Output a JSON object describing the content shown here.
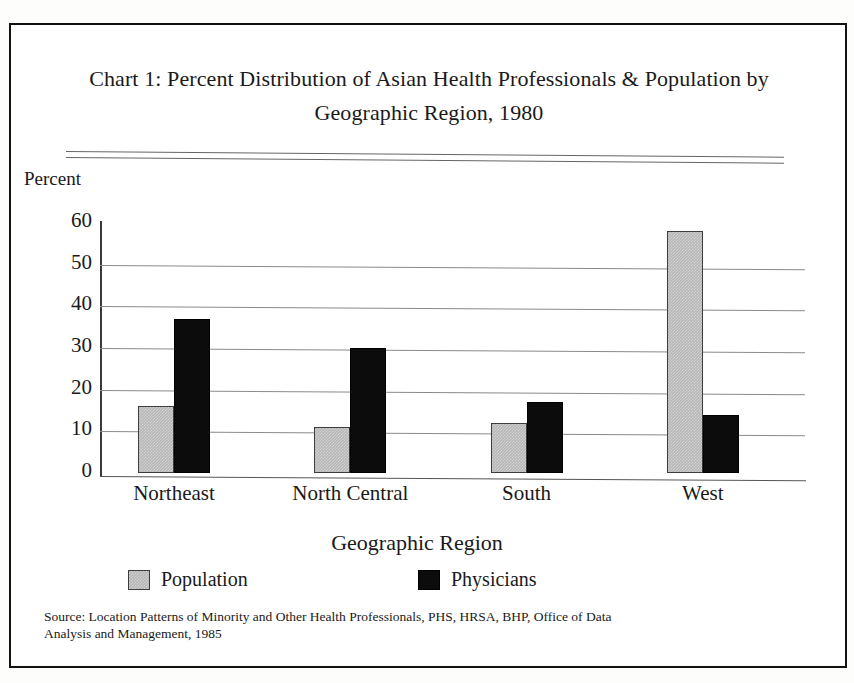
{
  "figure": {
    "title_line1": "Chart 1:  Percent Distribution of Asian Health Professionals & Population by",
    "title_line2": "Geographic Region, 1980",
    "y_axis_caption": "Percent",
    "x_axis_title": "Geographic Region",
    "source_line1": "Source:  Location Patterns of Minority and Other Health Professionals, PHS, HRSA, BHP, Office of Data",
    "source_line2": "Analysis and Management, 1985"
  },
  "colors": {
    "population": "#b6b6b6",
    "physicians": "#0c0c0c",
    "gridline": "#8a8a8a",
    "axis": "#3a3a3a",
    "text": "#1a1a1a",
    "page_background": "#ffffff",
    "border": "#111111"
  },
  "legend": {
    "position": "bottom",
    "entries": [
      {
        "label": "Population",
        "swatch": "population-swatch"
      },
      {
        "label": "Physicians",
        "swatch": "physicians-swatch"
      }
    ]
  },
  "chart_data": {
    "type": "bar",
    "title": "Chart 1:  Percent Distribution of Asian Health Professionals & Population by Geographic Region, 1980",
    "xlabel": "Geographic Region",
    "ylabel": "Percent",
    "ylim": [
      0,
      60
    ],
    "yticks": [
      0,
      10,
      20,
      30,
      40,
      50,
      60
    ],
    "ytick_labels": [
      "0",
      "10",
      "20",
      "30",
      "40",
      "50",
      "60"
    ],
    "grid": true,
    "grid_axis": "y",
    "categories": [
      "Northeast",
      "North Central",
      "South",
      "West"
    ],
    "series": [
      {
        "name": "Population",
        "values": [
          16,
          11,
          12,
          58
        ]
      },
      {
        "name": "Physicians",
        "values": [
          37,
          30,
          17,
          14
        ]
      }
    ]
  }
}
